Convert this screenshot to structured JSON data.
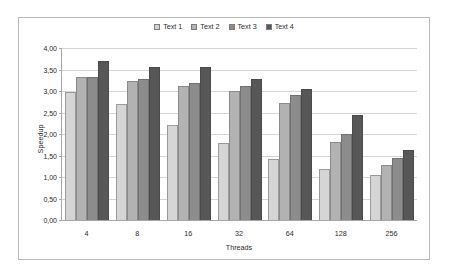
{
  "chart_data": {
    "type": "bar",
    "title": "",
    "xlabel": "Threads",
    "ylabel": "Speedup",
    "categories": [
      "4",
      "8",
      "16",
      "32",
      "64",
      "128",
      "256"
    ],
    "ylim": [
      0,
      4
    ],
    "ytick_labels": [
      "4,00",
      "3,50",
      "3,00",
      "2,50",
      "2,00",
      "1,50",
      "1,00",
      "0,50",
      "0,00"
    ],
    "ytick_values": [
      4.0,
      3.5,
      3.0,
      2.5,
      2.0,
      1.5,
      1.0,
      0.5,
      0.0
    ],
    "ytick_step": 0.5,
    "grid": true,
    "legend_position": "top-center",
    "decimal_separator": ",",
    "series": [
      {
        "name": "Text 1",
        "color": "#d5d5d5",
        "values": [
          2.98,
          2.69,
          2.21,
          1.78,
          1.42,
          1.18,
          1.05
        ]
      },
      {
        "name": "Text 2",
        "color": "#b2b2b2",
        "values": [
          3.32,
          3.23,
          3.12,
          3.0,
          2.73,
          1.82,
          1.29
        ]
      },
      {
        "name": "Text 3",
        "color": "#8c8c8c",
        "values": [
          3.32,
          3.27,
          3.18,
          3.12,
          2.91,
          1.99,
          1.44
        ]
      },
      {
        "name": "Text 4",
        "color": "#575757",
        "values": [
          3.7,
          3.56,
          3.55,
          3.29,
          3.05,
          2.45,
          1.63
        ]
      }
    ]
  }
}
